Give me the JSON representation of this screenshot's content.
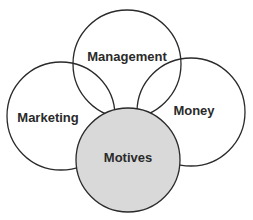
{
  "diagram": {
    "type": "venn-overlapping-circles",
    "circles": [
      {
        "id": "management",
        "label": "Management",
        "cx": 127,
        "cy": 64,
        "r": 54,
        "fill": "#ffffff"
      },
      {
        "id": "marketing",
        "label": "Marketing",
        "cx": 61,
        "cy": 116,
        "r": 54,
        "fill": "#ffffff"
      },
      {
        "id": "money",
        "label": "Money",
        "cx": 191,
        "cy": 112,
        "r": 54,
        "fill": "#ffffff"
      },
      {
        "id": "motives",
        "label": "Motives",
        "cx": 128,
        "cy": 160,
        "r": 52,
        "fill": "#d9d9d9"
      }
    ],
    "stroke": "#2a2a2a"
  }
}
